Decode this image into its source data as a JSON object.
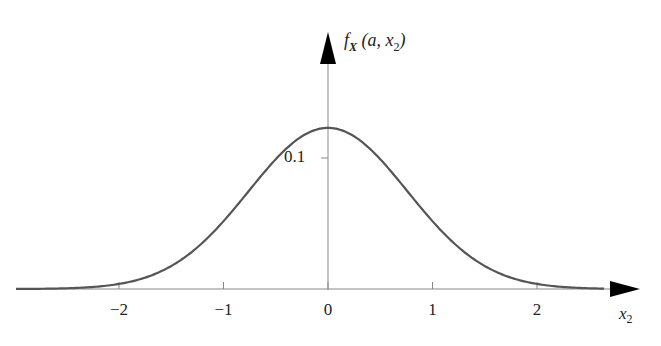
{
  "chart_data": {
    "type": "line",
    "title": "",
    "xlabel": "x2",
    "ylabel": "f_X (a, x2)",
    "xlim": [
      -3.0,
      2.9
    ],
    "ylim": [
      0,
      0.14
    ],
    "x_ticks": [
      -2,
      -1,
      0,
      1,
      2
    ],
    "x_tick_labels": [
      "−2",
      "−1",
      "0",
      "1",
      "2"
    ],
    "y_ticks": [
      0.1
    ],
    "y_tick_labels": [
      "0.1"
    ],
    "grid": false,
    "legend": null,
    "series": [
      {
        "name": "f_X(a, x2)",
        "shape": "gaussian",
        "mean": 0,
        "std": 0.76,
        "peak": 0.123,
        "x": [
          -3.0,
          -2.5,
          -2.0,
          -1.5,
          -1.0,
          -0.5,
          0.0,
          0.5,
          1.0,
          1.5,
          2.0,
          2.5,
          2.9
        ],
        "values": [
          0.0,
          0.0005,
          0.0039,
          0.0176,
          0.0518,
          0.0795,
          0.123,
          0.0795,
          0.0518,
          0.0176,
          0.0039,
          0.0005,
          0.0001
        ]
      }
    ],
    "colors": {
      "curve": "#555555",
      "axis": "#888888",
      "arrow": "#000000"
    }
  },
  "labels": {
    "y_axis_f": "f",
    "y_axis_sub": "X",
    "y_axis_args_open": " (a, x",
    "y_axis_args_sub": "2",
    "y_axis_args_close": ")",
    "x_axis_main": "x",
    "x_axis_sub": "2"
  }
}
